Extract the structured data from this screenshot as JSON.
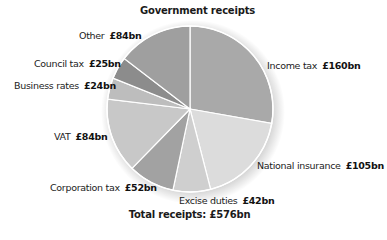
{
  "chart_data": {
    "type": "pie",
    "title": "Government receipts",
    "footer": "Total receipts: £576bn",
    "total": 576,
    "unit": "£bn",
    "start_angle_deg": 0,
    "direction": "clockwise",
    "slices": [
      {
        "name": "Income tax",
        "value": 160,
        "value_label": "£160bn",
        "color": "#a9a9a9"
      },
      {
        "name": "National insurance",
        "value": 105,
        "value_label": "£105bn",
        "color": "#dcdcdc"
      },
      {
        "name": "Excise duties",
        "value": 42,
        "value_label": "£42bn",
        "color": "#cfcfcf"
      },
      {
        "name": "Corporation tax",
        "value": 52,
        "value_label": "£52bn",
        "color": "#a2a2a2"
      },
      {
        "name": "VAT",
        "value": 84,
        "value_label": "£84bn",
        "color": "#c8c8c8"
      },
      {
        "name": "Business rates",
        "value": 24,
        "value_label": "£24bn",
        "color": "#bdbdbd"
      },
      {
        "name": "Council tax",
        "value": 25,
        "value_label": "£25bn",
        "color": "#8c8c8c"
      },
      {
        "name": "Other",
        "value": 84,
        "value_label": "£84bn",
        "color": "#9f9f9f"
      }
    ],
    "legend_position": "labels-around-pie"
  }
}
